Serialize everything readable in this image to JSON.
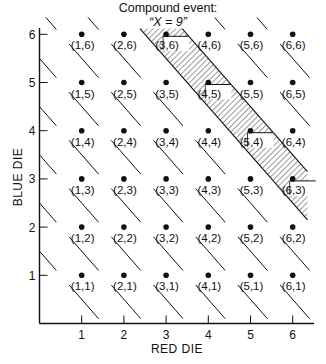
{
  "title": {
    "line1": "Compound event:",
    "line2": "“X = 9”"
  },
  "chart_data": {
    "type": "scatter",
    "xlabel": "RED DIE",
    "ylabel": "BLUE DIE",
    "xlim": [
      0,
      6.5
    ],
    "ylim": [
      0,
      6.5
    ],
    "xticks": [
      1,
      2,
      3,
      4,
      5,
      6
    ],
    "yticks": [
      1,
      2,
      3,
      4,
      5,
      6
    ],
    "grid": false,
    "points": [
      {
        "x": 1,
        "y": 1,
        "label": "(1,1)"
      },
      {
        "x": 2,
        "y": 1,
        "label": "(2,1)"
      },
      {
        "x": 3,
        "y": 1,
        "label": "(3,1)"
      },
      {
        "x": 4,
        "y": 1,
        "label": "(4,1)"
      },
      {
        "x": 5,
        "y": 1,
        "label": "(5,1)"
      },
      {
        "x": 6,
        "y": 1,
        "label": "(6,1)"
      },
      {
        "x": 1,
        "y": 2,
        "label": "(1,2)"
      },
      {
        "x": 2,
        "y": 2,
        "label": "(2,2)"
      },
      {
        "x": 3,
        "y": 2,
        "label": "(3,2)"
      },
      {
        "x": 4,
        "y": 2,
        "label": "(4,2)"
      },
      {
        "x": 5,
        "y": 2,
        "label": "(5,2)"
      },
      {
        "x": 6,
        "y": 2,
        "label": "(6,2)"
      },
      {
        "x": 1,
        "y": 3,
        "label": "(1,3)"
      },
      {
        "x": 2,
        "y": 3,
        "label": "(2,3)"
      },
      {
        "x": 3,
        "y": 3,
        "label": "(3,3)"
      },
      {
        "x": 4,
        "y": 3,
        "label": "(4,3)"
      },
      {
        "x": 5,
        "y": 3,
        "label": "(5,3)"
      },
      {
        "x": 6,
        "y": 3,
        "label": "(6,3)"
      },
      {
        "x": 1,
        "y": 4,
        "label": "(1,4)"
      },
      {
        "x": 2,
        "y": 4,
        "label": "(2,4)"
      },
      {
        "x": 3,
        "y": 4,
        "label": "(3,4)"
      },
      {
        "x": 4,
        "y": 4,
        "label": "(4,4)"
      },
      {
        "x": 5,
        "y": 4,
        "label": "(5,4)"
      },
      {
        "x": 6,
        "y": 4,
        "label": "(6,4)"
      },
      {
        "x": 1,
        "y": 5,
        "label": "(1,5)"
      },
      {
        "x": 2,
        "y": 5,
        "label": "(2,5)"
      },
      {
        "x": 3,
        "y": 5,
        "label": "(3,5)"
      },
      {
        "x": 4,
        "y": 5,
        "label": "(4,5)"
      },
      {
        "x": 5,
        "y": 5,
        "label": "(5,5)"
      },
      {
        "x": 6,
        "y": 5,
        "label": "(6,5)"
      },
      {
        "x": 1,
        "y": 6,
        "label": "(1,6)"
      },
      {
        "x": 2,
        "y": 6,
        "label": "(2,6)"
      },
      {
        "x": 3,
        "y": 6,
        "label": "(3,6)"
      },
      {
        "x": 4,
        "y": 6,
        "label": "(4,6)"
      },
      {
        "x": 5,
        "y": 6,
        "label": "(5,6)"
      },
      {
        "x": 6,
        "y": 6,
        "label": "(6,6)"
      }
    ],
    "sum_boundary_lines": [
      1.5,
      2.5,
      3.5,
      4.5,
      5.5,
      6.5,
      7.5,
      8.5,
      9.5,
      10.5,
      11.5
    ],
    "highlighted_event": {
      "name": "X = 9",
      "sum": 9,
      "band": [
        8.5,
        9.5
      ],
      "fill": "hatched",
      "points": [
        "(3,6)",
        "(4,5)",
        "(5,4)",
        "(6,3)"
      ]
    }
  }
}
